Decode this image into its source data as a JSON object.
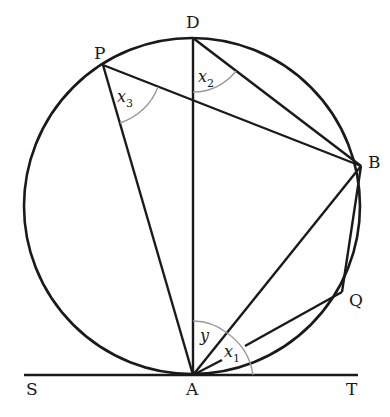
{
  "diagram": {
    "type": "circle-geometry",
    "circle": {
      "cx": 192,
      "cy": 206,
      "r": 168
    },
    "points": {
      "D": {
        "label": "D",
        "x": 193,
        "y": 38
      },
      "P": {
        "label": "P",
        "x": 103,
        "y": 65
      },
      "B": {
        "label": "B",
        "x": 361,
        "y": 166
      },
      "Q": {
        "label": "Q",
        "x": 342,
        "y": 292
      },
      "A": {
        "label": "A",
        "x": 193,
        "y": 375
      },
      "S": {
        "label": "S",
        "x": 24,
        "y": 375
      },
      "T": {
        "label": "T",
        "x": 358,
        "y": 375
      }
    },
    "angles": {
      "x1": {
        "base": "x",
        "sub": "1"
      },
      "x2": {
        "base": "x",
        "sub": "2"
      },
      "x3": {
        "base": "x",
        "sub": "3"
      },
      "y": {
        "base": "y"
      }
    },
    "colors": {
      "line": "#1a1a1a",
      "arc": "#999999",
      "background": "#ffffff"
    }
  }
}
